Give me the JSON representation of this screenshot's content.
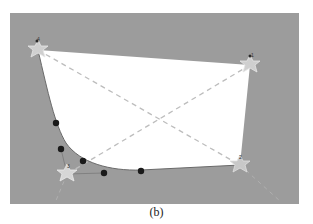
{
  "figure": {
    "caption": "(b)",
    "colors": {
      "background": "#9c9c9c",
      "surface": "#ffffff",
      "diagonal": "#bdbdbd",
      "marker": "#d8d8d8",
      "control_point": "#1a1a1a"
    },
    "corner_markers": [
      {
        "label": "4",
        "x": 28,
        "y": 37
      },
      {
        "label": "1",
        "x": 240,
        "y": 52
      },
      {
        "label": "3",
        "x": 57,
        "y": 161
      },
      {
        "label": "2",
        "x": 230,
        "y": 152
      }
    ],
    "control_points": [
      {
        "x": 46,
        "y": 110
      },
      {
        "x": 51,
        "y": 136
      },
      {
        "x": 73,
        "y": 148
      },
      {
        "x": 94,
        "y": 160
      },
      {
        "x": 131,
        "y": 158
      }
    ]
  }
}
